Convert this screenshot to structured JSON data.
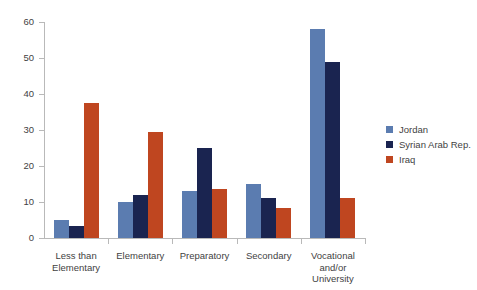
{
  "chart_data": {
    "type": "bar",
    "title": "",
    "subtitle": "",
    "xlabel": "",
    "ylabel": "",
    "ylim": [
      0,
      60
    ],
    "yticks": [
      0,
      10,
      20,
      30,
      40,
      50,
      60
    ],
    "grid": false,
    "legend_position": "right",
    "categories": [
      "Less than Elementary",
      "Elementary",
      "Preparatory",
      "Secondary",
      "Vocational and/or University"
    ],
    "category_lines": [
      [
        "Less than",
        "Elementary"
      ],
      [
        "Elementary"
      ],
      [
        "Preparatory"
      ],
      [
        "Secondary"
      ],
      [
        "Vocational",
        "and/or",
        "University"
      ]
    ],
    "series": [
      {
        "name": "Jordan",
        "color": "#5b7cb0",
        "values": [
          5.0,
          10.0,
          13.0,
          15.0,
          58.0
        ]
      },
      {
        "name": "Syrian Arab Rep.",
        "color": "#1a2450",
        "values": [
          3.2,
          12.0,
          25.0,
          11.0,
          49.0
        ]
      },
      {
        "name": "Iraq",
        "color": "#bf4620",
        "values": [
          37.4,
          29.5,
          13.7,
          8.2,
          11.0
        ]
      }
    ]
  },
  "legend": {
    "entries": [
      {
        "label": "Jordan",
        "color": "#5b7cb0"
      },
      {
        "label": "Syrian Arab Rep.",
        "color": "#1a2450"
      },
      {
        "label": "Iraq",
        "color": "#bf4620"
      }
    ]
  },
  "axis": {
    "y_tick_labels": [
      "0",
      "10",
      "20",
      "30",
      "40",
      "50",
      "60"
    ]
  }
}
